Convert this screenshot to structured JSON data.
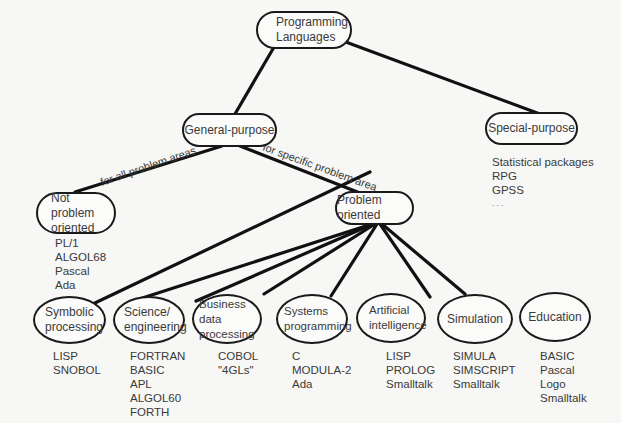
{
  "diagram": {
    "root": {
      "label": "Programming\nLanguages"
    },
    "level1": [
      {
        "id": "general",
        "label": "General-purpose"
      },
      {
        "id": "special",
        "label": "Special-purpose",
        "examples": [
          "Statistical packages",
          "RPG",
          "GPSS",
          ". . ."
        ]
      }
    ],
    "edge_labels": {
      "for_all": "for all problem areas",
      "for_specific": "for specific problem area"
    },
    "level2": [
      {
        "id": "not_oriented",
        "label": "Not problem\noriented",
        "examples": [
          "PL/1",
          "ALGOL68",
          "Pascal",
          "Ada"
        ]
      },
      {
        "id": "oriented",
        "label": "Problem oriented"
      }
    ],
    "level3": [
      {
        "label": "Symbolic\nprocessing",
        "examples": [
          "LISP",
          "SNOBOL"
        ]
      },
      {
        "label": "Science/\nengineering",
        "examples": [
          "FORTRAN",
          "BASIC",
          "APL",
          "ALGOL60",
          "FORTH"
        ]
      },
      {
        "label": "Business data\nprocessing",
        "examples": [
          "COBOL",
          "\"4GLs\""
        ]
      },
      {
        "label": "Systems\nprogramming",
        "examples": [
          "C",
          "MODULA-2",
          "Ada"
        ]
      },
      {
        "label": "Artificial\nintelligence",
        "examples": [
          "LISP",
          "PROLOG",
          "Smalltalk"
        ]
      },
      {
        "label": "Simulation",
        "examples": [
          "SIMULA",
          "SIMSCRIPT",
          "Smalltalk"
        ]
      },
      {
        "label": "Education",
        "examples": [
          "BASIC",
          "Pascal",
          "Logo",
          "Smalltalk"
        ]
      }
    ]
  }
}
